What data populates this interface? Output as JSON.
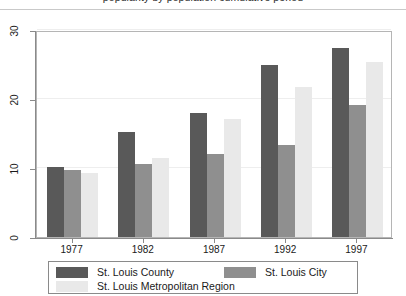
{
  "figure": {
    "title_fragment": "popularity by population cumulative period",
    "background": "#ffffff"
  },
  "legend": {
    "entries": [
      {
        "label": "St. Louis County",
        "color": "#595959"
      },
      {
        "label": "St. Louis Metropolitan Region",
        "color": "#e9e9e9"
      },
      {
        "label": "St. Louis City",
        "color": "#8f8f8f"
      }
    ]
  },
  "chart_data": {
    "type": "bar",
    "title": "",
    "xlabel": "",
    "ylabel": "",
    "categories": [
      "1977",
      "1982",
      "1987",
      "1992",
      "1997"
    ],
    "series": [
      {
        "name": "St. Louis County",
        "color": "#595959",
        "values": [
          10.2,
          15.2,
          18.0,
          25.0,
          27.4
        ]
      },
      {
        "name": "St. Louis City",
        "color": "#8f8f8f",
        "values": [
          9.7,
          10.6,
          12.0,
          13.3,
          19.2
        ]
      },
      {
        "name": "St. Louis Metropolitan Region",
        "color": "#e9e9e9",
        "values": [
          9.3,
          11.5,
          17.1,
          21.8,
          25.4
        ]
      }
    ],
    "ylim": [
      0,
      30
    ],
    "yticks": [
      0,
      10,
      20,
      30
    ],
    "ytick_labels": [
      "0",
      "10",
      "20",
      "30"
    ],
    "grid": true,
    "legend_position": "bottom"
  }
}
